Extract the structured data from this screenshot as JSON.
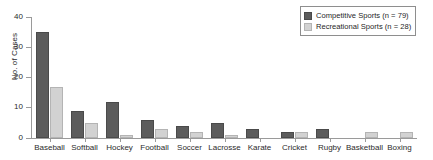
{
  "chart_data": {
    "type": "bar",
    "title": "",
    "xlabel": "",
    "ylabel": "No. of Cases",
    "ylim": [
      0,
      40
    ],
    "yticks": [
      0,
      10,
      20,
      30,
      40
    ],
    "grid": false,
    "legend_position": "top-right",
    "categories": [
      "Baseball",
      "Softball",
      "Hockey",
      "Football",
      "Soccer",
      "Lacrosse",
      "Karate",
      "Cricket",
      "Rugby",
      "Basketball",
      "Boxing"
    ],
    "series": [
      {
        "name": "Competitive Sports (n = 79)",
        "color": "#5c5c5c",
        "values": [
          35,
          9,
          12,
          6,
          4,
          5,
          3,
          2,
          3,
          0,
          0
        ]
      },
      {
        "name": "Recreational Sports (n = 28)",
        "color": "#d2d2d2",
        "values": [
          17,
          5,
          1,
          3,
          2,
          1,
          0,
          2,
          0,
          2,
          2
        ]
      }
    ]
  },
  "legend": {
    "items": [
      {
        "label": "Competitive Sports (n = 79)",
        "swatch": "competitive"
      },
      {
        "label": "Recreational Sports (n = 28)",
        "swatch": "recreational"
      }
    ]
  },
  "axes": {
    "y_title": "No. of Cases",
    "y_tick_labels": [
      "0",
      "10",
      "20",
      "30",
      "40"
    ]
  }
}
